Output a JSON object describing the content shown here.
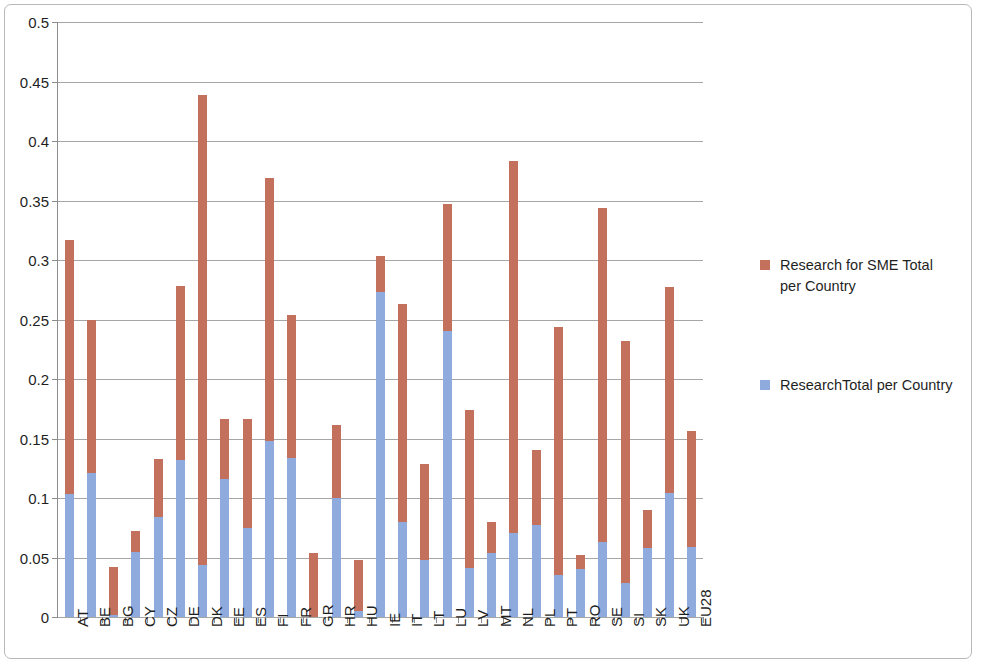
{
  "chart_data": {
    "type": "bar",
    "subtype": "stacked-column",
    "title": "",
    "xlabel": "",
    "ylabel": "",
    "ylim": [
      0,
      0.5
    ],
    "ytick_values": [
      0,
      0.05,
      0.1,
      0.15,
      0.2,
      0.25,
      0.3,
      0.35,
      0.4,
      0.45,
      0.5
    ],
    "ytick_labels": [
      "0",
      "0.05",
      "0.1",
      "0.15",
      "0.2",
      "0.25",
      "0.3",
      "0.35",
      "0.4",
      "0.45",
      "0.5"
    ],
    "grid": true,
    "legend_position": "right",
    "categories": [
      "AT",
      "BE",
      "BG",
      "CY",
      "CZ",
      "DE",
      "DK",
      "EE",
      "ES",
      "FI",
      "FR",
      "GR",
      "HR",
      "HU",
      "IE",
      "IT",
      "LT",
      "LU",
      "LV",
      "MT",
      "NL",
      "PL",
      "PT",
      "RO",
      "SE",
      "SI",
      "SK",
      "UK",
      "EU28"
    ],
    "series": [
      {
        "name": "ResearchTotal per Country",
        "color": "#8faadc",
        "values": [
          0.103,
          0.121,
          0.002,
          0.055,
          0.084,
          0.132,
          0.044,
          0.116,
          0.075,
          0.148,
          0.134,
          0.0,
          0.1,
          0.005,
          0.273,
          0.08,
          0.048,
          0.24,
          0.041,
          0.054,
          0.071,
          0.077,
          0.035,
          0.04,
          0.063,
          0.029,
          0.058,
          0.104,
          0.059
        ]
      },
      {
        "name": "Research for SME Total per Country",
        "color": "#c3705c",
        "values": [
          0.214,
          0.129,
          0.04,
          0.017,
          0.049,
          0.146,
          0.395,
          0.05,
          0.091,
          0.221,
          0.12,
          0.054,
          0.061,
          0.043,
          0.03,
          0.183,
          0.081,
          0.107,
          0.133,
          0.026,
          0.312,
          0.063,
          0.209,
          0.012,
          0.281,
          0.203,
          0.032,
          0.173,
          0.097
        ]
      }
    ],
    "totals": [
      0.317,
      0.25,
      0.042,
      0.072,
      0.133,
      0.278,
      0.439,
      0.166,
      0.166,
      0.369,
      0.254,
      0.054,
      0.161,
      0.048,
      0.303,
      0.263,
      0.129,
      0.347,
      0.174,
      0.08,
      0.383,
      0.14,
      0.244,
      0.052,
      0.344,
      0.232,
      0.09,
      0.277,
      0.156
    ]
  },
  "legend": {
    "entries": [
      {
        "label": "Research for SME Total per Country",
        "color": "#c3705c",
        "swatch_name": "legend-swatch-red"
      },
      {
        "label": "ResearchTotal per Country",
        "color": "#8faadc",
        "swatch_name": "legend-swatch-blue"
      }
    ]
  }
}
